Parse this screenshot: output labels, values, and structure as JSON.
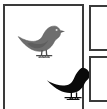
{
  "figure": {
    "kind": "illustration-panel",
    "background_color": "#ffffff",
    "border_color": "#3a3a3a",
    "main_panel": {
      "label": "bird-illustration-panel",
      "subjects": [
        {
          "name": "gray-finch",
          "pose": "perched, facing right, head raised",
          "fill_color": "#6e6e6e",
          "outline_color": "#555555",
          "position": "upper-left"
        },
        {
          "name": "black-finch",
          "pose": "perched, facing right, tail lowered",
          "fill_color": "#0a0a0a",
          "outline_color": "#0a0a0a",
          "position": "lower-right"
        }
      ]
    },
    "side_panels": [
      {
        "label": "side-panel-top",
        "content": "",
        "state": "empty"
      },
      {
        "label": "side-panel-bottom",
        "content": "",
        "state": "empty"
      }
    ]
  }
}
